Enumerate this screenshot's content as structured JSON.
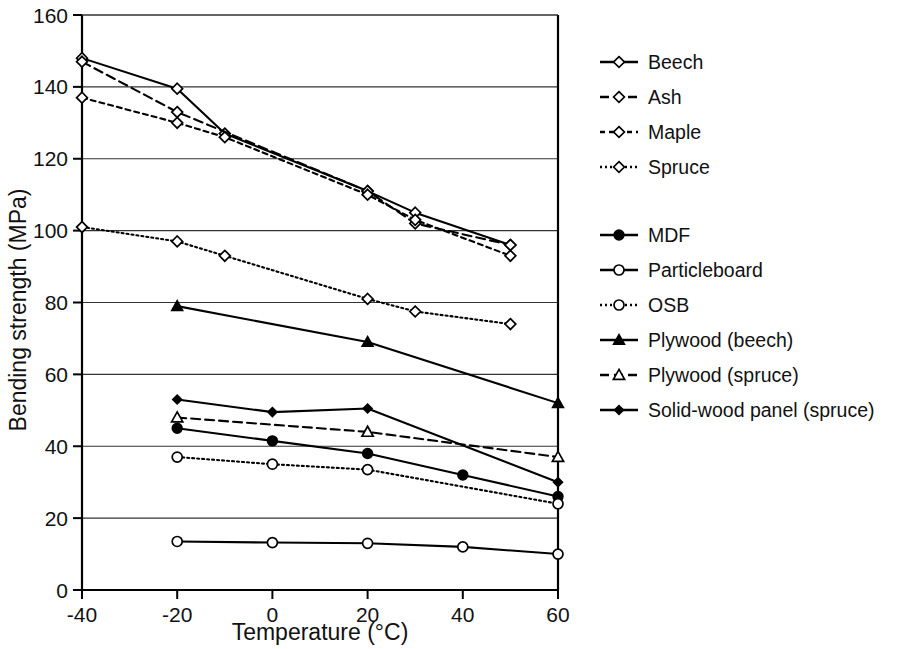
{
  "chart_data": {
    "type": "line",
    "title": "",
    "xlabel": "Temperature (°C)",
    "ylabel": "Bending strength (MPa)",
    "xlim": [
      -40,
      60
    ],
    "ylim": [
      0,
      160
    ],
    "xticks": [
      -40,
      -20,
      0,
      20,
      40,
      60
    ],
    "xtick_labels": [
      "-40",
      "-20",
      "0",
      "20",
      "40",
      "60"
    ],
    "yticks": [
      0,
      20,
      40,
      60,
      80,
      100,
      120,
      140,
      160
    ],
    "ytick_labels": [
      "0",
      "20",
      "40",
      "60",
      "80",
      "100",
      "120",
      "140",
      "160"
    ],
    "grid": "horizontal",
    "legend_position": "right",
    "series": [
      {
        "name": "Beech",
        "marker": "diamond-open",
        "dash": "solid",
        "x": [
          -40,
          -20,
          -10,
          20,
          30,
          50
        ],
        "values": [
          148,
          139.5,
          127,
          111,
          105,
          96
        ]
      },
      {
        "name": "Ash",
        "marker": "diamond-open",
        "dash": "dashed",
        "x": [
          -40,
          -20,
          20,
          30,
          50
        ],
        "values": [
          147,
          133,
          111,
          102,
          96
        ]
      },
      {
        "name": "Maple",
        "marker": "diamond-open",
        "dash": "dash-short",
        "x": [
          -40,
          -20,
          -10,
          20,
          30,
          50
        ],
        "values": [
          137,
          130,
          126,
          110,
          103,
          93
        ]
      },
      {
        "name": "Spruce",
        "marker": "diamond-open",
        "dash": "dotted",
        "x": [
          -40,
          -20,
          -10,
          20,
          30,
          50
        ],
        "values": [
          101,
          97,
          93,
          81,
          77.5,
          74
        ]
      },
      {
        "name": "MDF",
        "marker": "circle-filled",
        "dash": "solid",
        "x": [
          -20,
          0,
          20,
          40,
          60
        ],
        "values": [
          45,
          41.5,
          38,
          32,
          26
        ]
      },
      {
        "name": "Particleboard",
        "marker": "circle-open",
        "dash": "solid",
        "x": [
          -20,
          0,
          20,
          40,
          60
        ],
        "values": [
          13.5,
          13.2,
          13,
          12,
          10
        ]
      },
      {
        "name": "OSB",
        "marker": "circle-open",
        "dash": "dotted",
        "x": [
          -20,
          0,
          20,
          60
        ],
        "values": [
          37,
          35,
          33.5,
          24
        ]
      },
      {
        "name": "Plywood (beech)",
        "marker": "triangle-filled",
        "dash": "solid",
        "x": [
          -20,
          20,
          60
        ],
        "values": [
          79,
          69,
          52
        ]
      },
      {
        "name": "Plywood (spruce)",
        "marker": "triangle-open",
        "dash": "dashed",
        "x": [
          -20,
          20,
          60
        ],
        "values": [
          48,
          44,
          37
        ]
      },
      {
        "name": "Solid-wood panel (spruce)",
        "marker": "diamond-filled",
        "dash": "solid",
        "x": [
          -20,
          0,
          20,
          60
        ],
        "values": [
          53,
          49.5,
          50.5,
          30
        ]
      }
    ],
    "legend_groups": [
      [
        "Beech",
        "Ash",
        "Maple",
        "Spruce"
      ],
      [
        "MDF",
        "Particleboard",
        "OSB",
        "Plywood (beech)",
        "Plywood (spruce)",
        "Solid-wood panel (spruce)"
      ]
    ],
    "colors": {
      "line": "#000000",
      "grid": "#333333",
      "axis": "#000000",
      "background": "#ffffff"
    }
  }
}
